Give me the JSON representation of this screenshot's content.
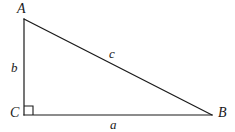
{
  "figure": {
    "kind": "right-triangle-diagram",
    "width": 235,
    "height": 132,
    "background_color": "#ffffff",
    "stroke_color": "#1a1a1a",
    "stroke_width": 1.2
  },
  "vertices": [
    {
      "id": "A",
      "label": "A",
      "x": 24,
      "y": 19
    },
    {
      "id": "B",
      "label": "B",
      "x": 212,
      "y": 115
    },
    {
      "id": "C",
      "label": "C",
      "x": 24,
      "y": 115
    }
  ],
  "sides": [
    {
      "id": "a",
      "label": "a",
      "from": "C",
      "to": "B",
      "role": "base-leg"
    },
    {
      "id": "b",
      "label": "b",
      "from": "A",
      "to": "C",
      "role": "vertical-leg"
    },
    {
      "id": "c",
      "label": "c",
      "from": "A",
      "to": "B",
      "role": "hypotenuse"
    }
  ],
  "right_angle": {
    "at_vertex": "C",
    "marker": "square",
    "size": 9,
    "measure": "90"
  },
  "paths": {
    "leg_b": "M 24 19 L 24 115",
    "leg_a": "M 24 115 L 212 115",
    "hypotenuse_c": "M 24 19 L 212 115",
    "right_angle_marker": "M 24 106 L 33 106 L 33 115"
  }
}
